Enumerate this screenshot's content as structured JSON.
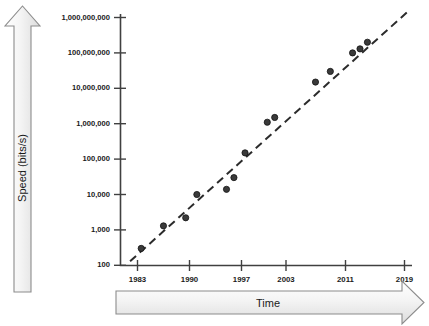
{
  "chart_data": {
    "type": "scatter",
    "title": "",
    "subtitle": "",
    "xlabel": "Time",
    "ylabel": "Speed (bits/s)",
    "yscale": "log",
    "ylim": [
      100,
      1000000000
    ],
    "xlim": [
      1981,
      2021
    ],
    "grid": false,
    "legend": null,
    "y_tick_labels": [
      "1,000,000,000",
      "100,000,000",
      "10,000,000",
      "1,000,000",
      "100,000",
      "10,000",
      "1,000",
      "100"
    ],
    "y_tick_values": [
      1000000000,
      100000000,
      10000000,
      1000000,
      100000,
      10000,
      1000,
      100
    ],
    "x_tick_labels": [
      "1983",
      "1990",
      "1997",
      "2003",
      "2011",
      "2019"
    ],
    "x_tick_values": [
      1983,
      1990,
      1997,
      2003,
      2011,
      2019
    ],
    "x": [
      1983.5,
      1986.5,
      1989.5,
      1991.0,
      1995.0,
      1996.0,
      1997.5,
      2000.5,
      2001.5,
      2007.0,
      2009.0,
      2012.0,
      2013.0,
      2014.0
    ],
    "y": [
      300,
      1300,
      2200,
      10000,
      14000,
      30000,
      150000,
      1100000,
      1500000,
      15000000,
      30000000,
      100000000,
      130000000,
      200000000
    ],
    "points": [
      {
        "x": 1983.5,
        "y": 300
      },
      {
        "x": 1986.5,
        "y": 1300
      },
      {
        "x": 1989.5,
        "y": 2200
      },
      {
        "x": 1991.0,
        "y": 10000
      },
      {
        "x": 1995.0,
        "y": 14000
      },
      {
        "x": 1996.0,
        "y": 30000
      },
      {
        "x": 1997.5,
        "y": 150000
      },
      {
        "x": 2000.5,
        "y": 1100000
      },
      {
        "x": 2001.5,
        "y": 1500000
      },
      {
        "x": 2007.0,
        "y": 15000000
      },
      {
        "x": 2009.0,
        "y": 30000000
      },
      {
        "x": 2012.0,
        "y": 100000000
      },
      {
        "x": 2013.0,
        "y": 130000000
      },
      {
        "x": 2014.0,
        "y": 200000000
      }
    ],
    "trendline": {
      "style": "dashed",
      "x_start": 1982.0,
      "y_start": 130,
      "x_end": 2019.5,
      "y_end": 1500000000
    },
    "colors": {
      "marker": "#3a3a3a",
      "marker_edge": "#111111",
      "trendline": "#2b2b2b",
      "axis": "#404040",
      "arrow_fill": "#f0f0f0",
      "arrow_stroke": "#8c8c8c",
      "text": "#1a1a1a"
    }
  },
  "axes": {
    "y_arrow_label": "Speed (bits/s)",
    "x_arrow_label": "Time"
  }
}
